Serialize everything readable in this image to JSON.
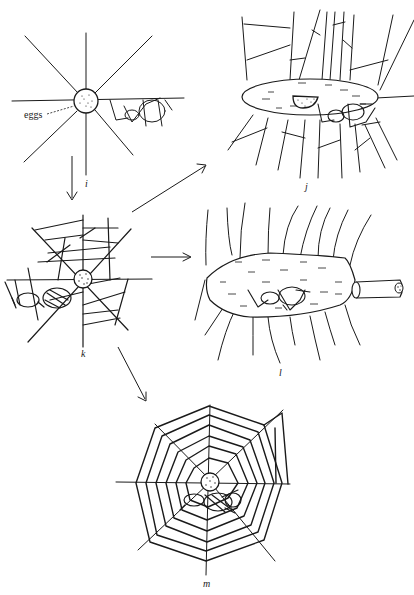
{
  "figure": {
    "panels": [
      {
        "id": "i",
        "label": "i",
        "description": "radial web frame with egg sac at hub and spider hanging from horizontal thread"
      },
      {
        "id": "j",
        "label": "j",
        "description": "spider under oval silk sheet with egg mass among hanging threads"
      },
      {
        "id": "k",
        "label": "k",
        "description": "irregular web with stippled egg sac and spider"
      },
      {
        "id": "l",
        "label": "l",
        "description": "elongated silk chamber with spider inside and tubular retreat"
      },
      {
        "id": "m",
        "label": "m",
        "description": "octagonal orb web with egg sac at hub and spider below"
      }
    ],
    "annotations": {
      "eggs_label": "eggs"
    },
    "arrows": [
      {
        "from": "i",
        "to": "k"
      },
      {
        "from": "k",
        "to": "j"
      },
      {
        "from": "k",
        "to": "l"
      },
      {
        "from": "k",
        "to": "m"
      }
    ],
    "colors": {
      "ink": "#1a1a1a",
      "background": "#ffffff"
    }
  }
}
